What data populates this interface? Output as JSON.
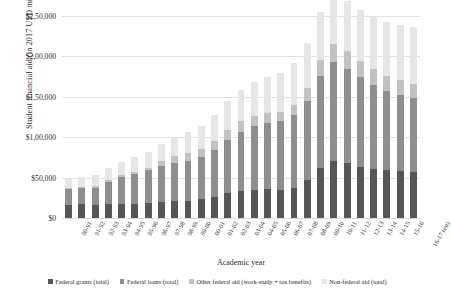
{
  "chart_data": {
    "type": "bar",
    "stacked": true,
    "title": "",
    "xlabel": "Academic year",
    "ylabel": "Student financial aid (in 2017 USD millions)",
    "ylim": [
      0,
      250000
    ],
    "ytick_values": [
      0,
      50000,
      100000,
      150000,
      200000,
      250000
    ],
    "ytick_labels": [
      "$0",
      "$50,000",
      "$1,00,000",
      "$1,50,000",
      "$2,00,000",
      "$2,50,000"
    ],
    "grid": true,
    "legend_position": "bottom",
    "categories": [
      "90-91",
      "91-92",
      "92-93",
      "93-94",
      "94-95",
      "95-96",
      "96-97",
      "97-98",
      "98-99",
      "99-00",
      "00-01",
      "01-02",
      "02-03",
      "03-04",
      "04-05",
      "05-06",
      "06-07",
      "07-08",
      "08-09",
      "09-10",
      "10-11",
      "11-12",
      "12-13",
      "13-14",
      "14-15",
      "15-16",
      "16-17 (est)"
    ],
    "series": [
      {
        "name": "Federal grants (total)",
        "color": "#565656",
        "values": [
          16500,
          16800,
          16200,
          17500,
          17800,
          17500,
          18200,
          19500,
          20500,
          21500,
          23000,
          26500,
          30500,
          33500,
          35000,
          35500,
          35000,
          37500,
          46500,
          62000,
          71000,
          67500,
          63500,
          61000,
          59500,
          58500,
          57500
        ]
      },
      {
        "name": "Federal loans (total)",
        "color": "#8e8e8e",
        "values": [
          19500,
          20500,
          21500,
          27500,
          33500,
          37500,
          41500,
          45000,
          47500,
          49500,
          52500,
          57500,
          66500,
          73500,
          78500,
          81500,
          84500,
          89500,
          98500,
          113500,
          122500,
          117500,
          110500,
          103500,
          97500,
          93500,
          90500
        ]
      },
      {
        "name": "Other federal aid (work-study + tax benefits)",
        "color": "#c2c2c2",
        "values": [
          1500,
          1600,
          1700,
          1800,
          1900,
          2000,
          2200,
          5500,
          8500,
          9500,
          10500,
          11500,
          12500,
          13500,
          13000,
          12500,
          12000,
          12500,
          16500,
          20500,
          22500,
          22000,
          20500,
          19500,
          19000,
          18500,
          18000
        ]
      },
      {
        "name": "Non-federal aid (total)",
        "color": "#e6e6e6",
        "values": [
          11500,
          12500,
          13500,
          15000,
          16500,
          18000,
          19500,
          21500,
          23500,
          25500,
          28500,
          31500,
          35500,
          38500,
          41500,
          44500,
          48500,
          52500,
          55500,
          58500,
          62500,
          61500,
          62500,
          64500,
          66500,
          68500,
          70500
        ]
      }
    ]
  },
  "legend": {
    "items": [
      {
        "label": "Federal grants (total)",
        "color": "#565656"
      },
      {
        "label": "Federal loans (total)",
        "color": "#8e8e8e"
      },
      {
        "label": "Other federal aid (work-study + tax benefits)",
        "color": "#c2c2c2"
      },
      {
        "label": "Non-federal aid (total)",
        "color": "#e6e6e6"
      }
    ]
  }
}
